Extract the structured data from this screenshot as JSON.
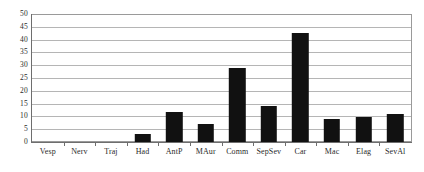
{
  "chart_data": {
    "type": "bar",
    "title": "",
    "subtitle": "",
    "xlabel": "",
    "ylabel": "",
    "categories": [
      "Vesp",
      "Nerv",
      "Traj",
      "Had",
      "AntP",
      "MAur",
      "Comm",
      "SepSev",
      "Car",
      "Mac",
      "Elag",
      "SevAl"
    ],
    "values": [
      0,
      0,
      0,
      3,
      12,
      7,
      29,
      14,
      43,
      9,
      10,
      11
    ],
    "ylim": [
      0,
      50
    ],
    "ytick_step": 5,
    "yticks": [
      0,
      5,
      10,
      15,
      20,
      25,
      30,
      35,
      40,
      45,
      50
    ],
    "ytick_labels": [
      "0",
      "5",
      "10",
      "15",
      "20",
      "25",
      "30",
      "35",
      "40",
      "45",
      "50"
    ],
    "grid": true,
    "grid_axis": "y",
    "legend": false,
    "legend_position": "none",
    "bar_color": "#111111",
    "grid_color": "#b5b5b5",
    "axis_color": "#6e6e6e",
    "background_color": "#ffffff",
    "annotations": []
  }
}
